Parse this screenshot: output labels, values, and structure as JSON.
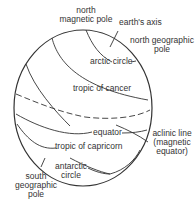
{
  "diagram": {
    "labels": {
      "north_magnetic_pole": "north\nmagnetic pole",
      "earths_axis": "earth's axis",
      "north_geographic_pole": "north geographic\npole",
      "arctic_circle": "arctic circle",
      "tropic_of_cancer": "tropic of cancer",
      "equator": "equator",
      "aclinic_line": "aclinic line\n(magnetic\nequator)",
      "tropic_of_capricorn": "tropic of capricorn",
      "antarctic_circle": "antarctic\ncircle",
      "south_geographic_pole": "south\ngeographic\npole"
    },
    "colors": {
      "line": "#333333",
      "background": "#ffffff"
    }
  }
}
